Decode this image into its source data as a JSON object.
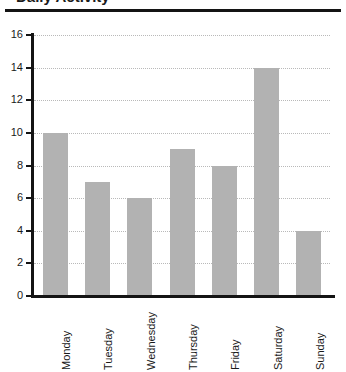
{
  "title_fragment": "Daily Activity",
  "chart_data": {
    "type": "bar",
    "title": "Daily Activity",
    "xlabel": "",
    "ylabel": "",
    "categories": [
      "Monday",
      "Tuesday",
      "Wednesday",
      "Thursday",
      "Friday",
      "Saturday",
      "Sunday"
    ],
    "values": [
      10,
      7,
      6,
      9,
      8,
      14,
      4
    ],
    "ylim": [
      0,
      16
    ],
    "ytick_labels": [
      "0",
      "2",
      "4",
      "6",
      "8",
      "10",
      "12",
      "14",
      "16"
    ],
    "ytick_values": [
      0,
      2,
      4,
      6,
      8,
      10,
      12,
      14,
      16
    ],
    "grid": true,
    "grid_style": "dotted",
    "legend": "none",
    "bar_color": "#b2b2b2",
    "axis_color": "#141414",
    "grid_color": "#b9b9b9"
  }
}
